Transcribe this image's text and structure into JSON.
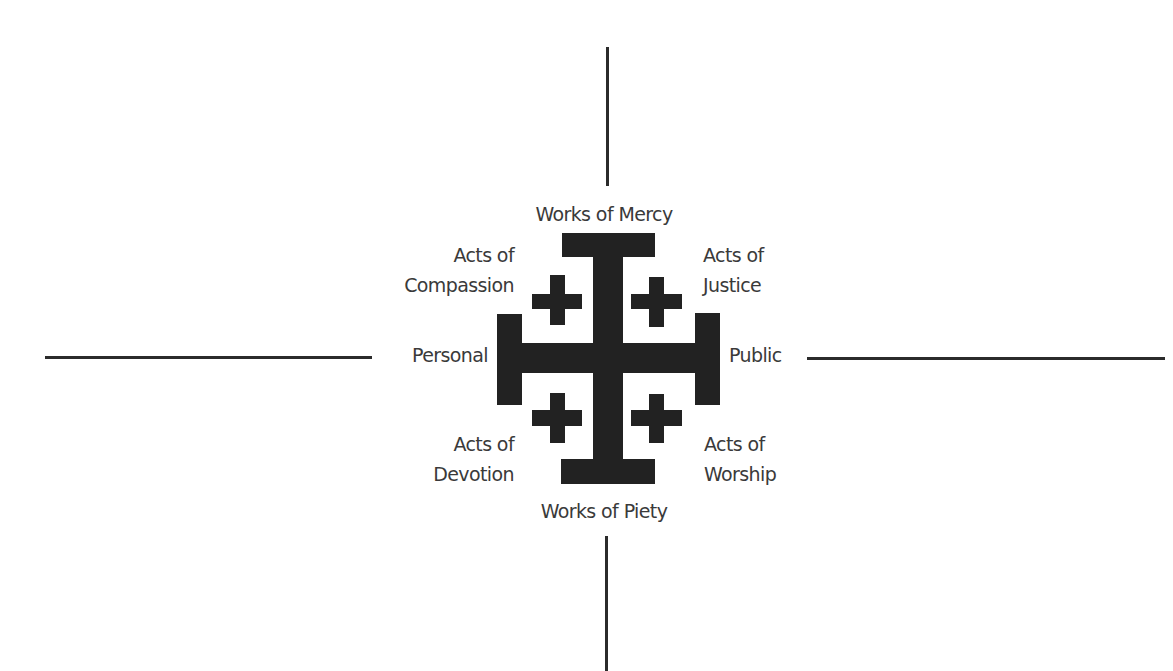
{
  "diagram": {
    "axes": {
      "top": "Works of Mercy",
      "bottom": "Works of Piety",
      "left": "Personal",
      "right": "Public"
    },
    "quadrants": {
      "top_left": {
        "line1": "Acts of",
        "line2": "Compassion"
      },
      "top_right": {
        "line1": "Acts of",
        "line2": "Justice"
      },
      "bottom_left": {
        "line1": "Acts of",
        "line2": "Devotion"
      },
      "bottom_right": {
        "line1": "Acts of",
        "line2": "Worship"
      }
    },
    "center_symbol": "jerusalem-cross",
    "colors": {
      "ink": "#222222",
      "text": "#3a3a3a",
      "line": "#2b2b2b",
      "background": "#ffffff"
    }
  }
}
